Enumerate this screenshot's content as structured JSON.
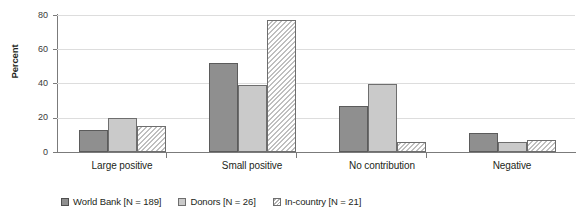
{
  "chart_data": {
    "type": "bar",
    "title": "",
    "xlabel": "",
    "ylabel": "Percent",
    "ylim": [
      0,
      80
    ],
    "yticks": [
      0,
      20,
      40,
      60,
      80
    ],
    "grid": true,
    "legend_position": "bottom-left",
    "categories": [
      "Large positive",
      "Small positive",
      "No contribution",
      "Negative"
    ],
    "series": [
      {
        "name": "World Bank [N = 189]",
        "style": "solid-dark-gray",
        "color": "#8f8f8f",
        "values": [
          13,
          52,
          27,
          11
        ]
      },
      {
        "name": "Donors [N = 26]",
        "style": "solid-light-gray",
        "color": "#cacaca",
        "values": [
          20,
          39,
          40,
          6
        ]
      },
      {
        "name": "In-country [N = 21]",
        "style": "diagonal-hatch",
        "color": "#ffffff",
        "values": [
          15,
          77,
          6,
          7
        ]
      }
    ]
  },
  "axis": {
    "y_title": "Percent",
    "y_tick_labels": [
      "80",
      "60",
      "40",
      "20",
      "0"
    ]
  },
  "legend": {
    "items": [
      {
        "label": "World Bank [N = 189]"
      },
      {
        "label": "Donors [N = 26]"
      },
      {
        "label": "In-country [N = 21]"
      }
    ]
  }
}
